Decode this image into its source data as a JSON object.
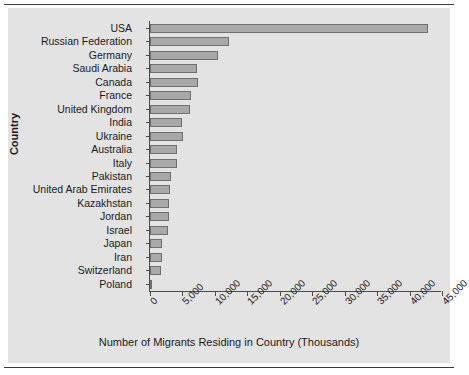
{
  "figure": {
    "title": "",
    "ylabel": "Country",
    "xlabel": "Number of Migrants Residing in Country (Thousands)"
  },
  "chart_data": {
    "type": "bar",
    "orientation": "horizontal",
    "title": "",
    "xlabel": "Number of Migrants Residing in Country (Thousands)",
    "ylabel": "Country",
    "xlim": [
      0,
      45000
    ],
    "xticks": [
      0,
      5000,
      10000,
      15000,
      20000,
      25000,
      30000,
      35000,
      40000,
      45000
    ],
    "xtick_labels": [
      "0",
      "5,000",
      "10,000",
      "15,000",
      "20,000",
      "25,000",
      "30,000",
      "35,000",
      "40,000",
      "45,000"
    ],
    "grid": false,
    "legend": false,
    "bar_color": "#a9a9a9",
    "bar_edge_color": "#6e6e6e",
    "panel_color": "#e3e3e3",
    "categories": [
      "USA",
      "Russian Federation",
      "Germany",
      "Saudi Arabia",
      "Canada",
      "France",
      "United Kingdom",
      "India",
      "Ukraine",
      "Australia",
      "Italy",
      "Pakistan",
      "United Arab Emirates",
      "Kazakhstan",
      "Jordan",
      "Israel",
      "Japan",
      "Iran",
      "Switzerland",
      "Poland"
    ],
    "values": [
      42800,
      12100,
      10500,
      7300,
      7400,
      6300,
      6100,
      4900,
      5150,
      4100,
      4100,
      3300,
      3100,
      3000,
      2900,
      2850,
      1900,
      1800,
      1700,
      360
    ]
  }
}
